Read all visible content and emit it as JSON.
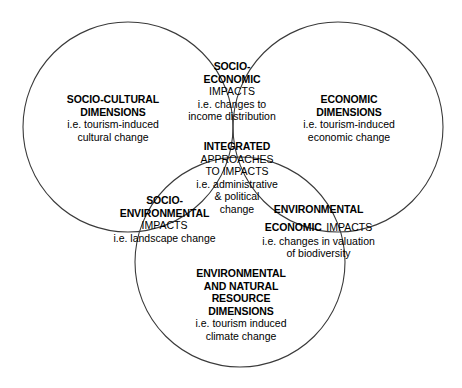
{
  "diagram": {
    "type": "venn-3-circle",
    "stroke_color": "#3a3a3a",
    "background_color": "#ffffff",
    "text_color": "#000000",
    "circles": [
      {
        "name": "socio-cultural",
        "cx": 128,
        "cy": 127,
        "r": 105
      },
      {
        "name": "economic",
        "cx": 338,
        "cy": 127,
        "r": 105
      },
      {
        "name": "environmental-natural-resource",
        "cx": 240,
        "cy": 262,
        "r": 105
      }
    ],
    "regions": {
      "socio_cultural": {
        "title_line1": "SOCIO-CULTURAL",
        "title_line2": "DIMENSIONS",
        "sub_line1": "i.e. tourism-induced",
        "sub_line2": "cultural change"
      },
      "economic": {
        "title_line1": "ECONOMIC",
        "title_line2": "DIMENSIONS",
        "sub_line1": "i.e. tourism-induced",
        "sub_line2": "economic change"
      },
      "environmental_natural_resource": {
        "title_line1": "ENVIRONMENTAL",
        "title_line2": "AND NATURAL",
        "title_line3": "RESOURCE",
        "title_line4": "DIMENSIONS",
        "sub_line1": "i.e. tourism induced",
        "sub_line2": "climate change"
      },
      "socio_economic": {
        "title_line1": "SOCIO-",
        "title_line2": "ECONOMIC",
        "title_line3": "IMPACTS",
        "sub_line1": "i.e. changes to",
        "sub_line2": "income distribution"
      },
      "socio_environmental": {
        "title_line1": "SOCIO-",
        "title_line2": "ENVIRONMENTAL",
        "title_line3": "IMPACTS",
        "sub_line1": "i.e. landscape change"
      },
      "environmental_economic": {
        "title_line1": "ENVIRONMENTAL",
        "title_line2": "ECONOMIC",
        "title_line2_reg": "IMPACTS",
        "sub_line1": "i.e. changes in valuation",
        "sub_line2": "of biodiversity"
      },
      "integrated": {
        "title_line1": "INTEGRATED",
        "title_line2": "APPROACHES",
        "title_line3": "TO IMPACTS",
        "sub_line1": "i.e. administrative",
        "sub_line2": "& political",
        "sub_line3": "change"
      }
    }
  }
}
